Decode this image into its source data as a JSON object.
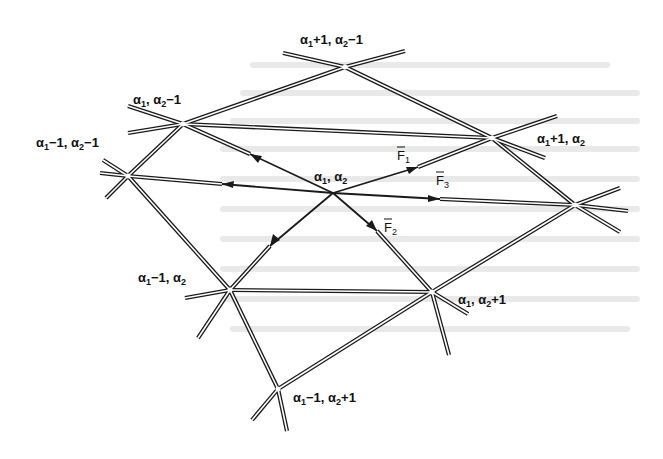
{
  "figure": {
    "nodes": [
      {
        "id": "c",
        "label": "α₁, α₂",
        "x": 333,
        "y": 193
      },
      {
        "id": "n1",
        "label": "α₁+1, α₂−1",
        "x": 345,
        "y": 67
      },
      {
        "id": "n2",
        "label": "α₁, α₂−1",
        "x": 183,
        "y": 124
      },
      {
        "id": "n3",
        "label": "α₁−1, α₂−1",
        "x": 128,
        "y": 176
      },
      {
        "id": "n4",
        "label": "α₁+1, α₂",
        "x": 492,
        "y": 138
      },
      {
        "id": "n5",
        "label": "",
        "x": 575,
        "y": 205
      },
      {
        "id": "n6",
        "label": "α₁−1, α₂",
        "x": 230,
        "y": 290
      },
      {
        "id": "n7",
        "label": "α₁, α₂+1",
        "x": 432,
        "y": 292
      },
      {
        "id": "n8",
        "label": "α₁−1, α₂+1",
        "x": 278,
        "y": 389
      }
    ],
    "labels": {
      "center": {
        "main": "α",
        "a": "1",
        "b": "2",
        "text": "α1, α2"
      },
      "n1": "α1+1, α2−1",
      "n2": "α1, α2−1",
      "n3": "α1−1, α2−1",
      "n4": "α1+1, α2",
      "n6": "α1−1, α2",
      "n7": "α1, α2+1",
      "n8": "α1−1, α2+1"
    },
    "forces": [
      {
        "name": "F1",
        "label": "F̄1",
        "from": "c",
        "toward": "n4"
      },
      {
        "name": "F2",
        "label": "F̄2",
        "from": "c",
        "toward": "n7"
      },
      {
        "name": "F3",
        "label": "F̄3",
        "from": "c",
        "toward": "n5"
      }
    ],
    "force_labels": {
      "f1_main": "F",
      "f1_sub": "1",
      "f2_main": "F",
      "f2_sub": "2",
      "f3_main": "F",
      "f3_sub": "3"
    },
    "colors": {
      "line": "#1a1a1a",
      "background": "#ffffff",
      "showthrough": "#e9e9e9"
    }
  }
}
